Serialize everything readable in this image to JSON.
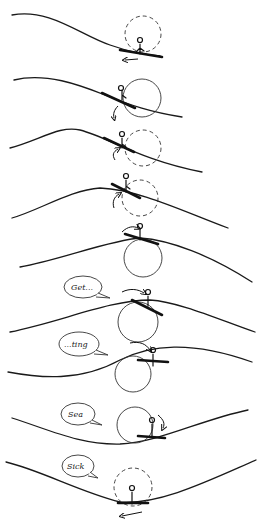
{
  "illustration": {
    "description": "Hand-drawn sequence of a kayaker rolling over ocean swells, 10 panels",
    "panels": [
      {
        "index": 1,
        "speech": null
      },
      {
        "index": 2,
        "speech": null
      },
      {
        "index": 3,
        "speech": null
      },
      {
        "index": 4,
        "speech": null
      },
      {
        "index": 5,
        "speech": null
      },
      {
        "index": 6,
        "speech": "Get..."
      },
      {
        "index": 7,
        "speech": "...ting"
      },
      {
        "index": 8,
        "speech": "Sea"
      },
      {
        "index": 9,
        "speech": "Sick"
      }
    ],
    "bubbles": {
      "b1": "Get...",
      "b2": "...ting",
      "b3": "Sea",
      "b4": "Sick"
    }
  }
}
